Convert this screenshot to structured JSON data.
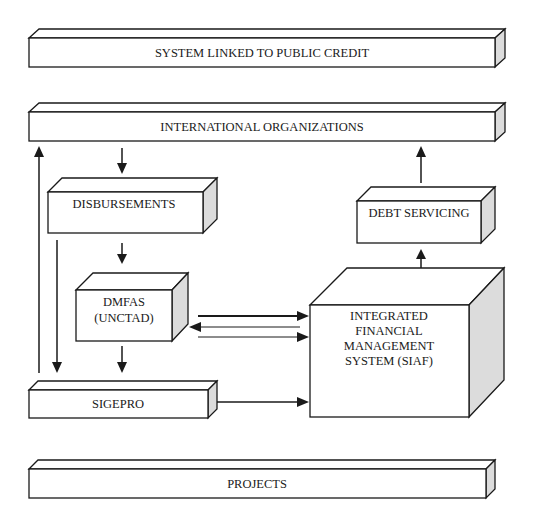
{
  "diagram": {
    "title": "",
    "colors": {
      "stroke": "#1a1a1a",
      "side_face": "#dcdcdc",
      "background": "#ffffff"
    },
    "nodes": {
      "public_credit": {
        "label": "SYSTEM LINKED TO PUBLIC CREDIT"
      },
      "intl_orgs": {
        "label": "INTERNATIONAL ORGANIZATIONS"
      },
      "disbursements": {
        "label": "DISBURSEMENTS"
      },
      "dmfas": {
        "line1": "DMFAS",
        "line2": "(UNCTAD)"
      },
      "sigepro": {
        "label": "SIGEPRO"
      },
      "debt_servicing": {
        "label": "DEBT SERVICING"
      },
      "siaf": {
        "line1": "INTEGRATED",
        "line2": "FINANCIAL",
        "line3": "MANAGEMENT",
        "line4": "SYSTEM (SIAF)"
      },
      "projects": {
        "label": "PROJECTS"
      }
    },
    "edges": [
      {
        "from": "INTERNATIONAL ORGANIZATIONS",
        "to": "DISBURSEMENTS"
      },
      {
        "from": "DISBURSEMENTS",
        "to": "DMFAS (UNCTAD)"
      },
      {
        "from": "DISBURSEMENTS",
        "to": "SIGEPRO"
      },
      {
        "from": "DMFAS (UNCTAD)",
        "to": "SIGEPRO"
      },
      {
        "from": "SIGEPRO",
        "to": "INTERNATIONAL ORGANIZATIONS"
      },
      {
        "from": "DMFAS (UNCTAD)",
        "to": "INTEGRATED FINANCIAL MANAGEMENT SYSTEM (SIAF)"
      },
      {
        "from": "INTEGRATED FINANCIAL MANAGEMENT SYSTEM (SIAF)",
        "to": "DMFAS (UNCTAD)"
      },
      {
        "from": "DMFAS (UNCTAD)",
        "to": "INTEGRATED FINANCIAL MANAGEMENT SYSTEM (SIAF)"
      },
      {
        "from": "SIGEPRO",
        "to": "INTEGRATED FINANCIAL MANAGEMENT SYSTEM (SIAF)"
      },
      {
        "from": "INTEGRATED FINANCIAL MANAGEMENT SYSTEM (SIAF)",
        "to": "DEBT SERVICING"
      },
      {
        "from": "DEBT SERVICING",
        "to": "INTERNATIONAL ORGANIZATIONS"
      }
    ]
  }
}
